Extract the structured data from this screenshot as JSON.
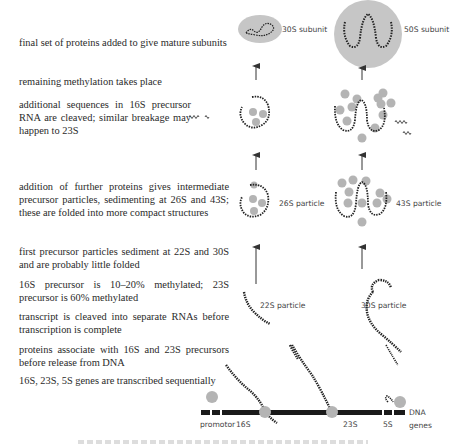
{
  "steps": [
    {
      "id": "final",
      "text": "final set of proteins added to give mature subunits"
    },
    {
      "id": "methylation",
      "text": "remaining methylation takes place"
    },
    {
      "id": "cleaved",
      "text": "additional sequences in 16S precursor RNA are cleaved; similar breakage may happen to 23S"
    },
    {
      "id": "intermediate",
      "text": "addition of further proteins gives intermediate precursor particles, sedimenting at 26S and 43S; these are folded into more compact structures"
    },
    {
      "id": "first",
      "text": "first precursor particles sediment at 22S and 30S and are probably little folded"
    },
    {
      "id": "methylated",
      "text": "16S precursor is 10–20% methylated; 23S precursor is 60% methylated"
    },
    {
      "id": "transcript",
      "text": "transcript is cleaved into separate RNAs before transcription is complete"
    },
    {
      "id": "associate",
      "text": "proteins associate with 16S and 23S precursors before release from DNA"
    },
    {
      "id": "transcribed",
      "text": "16S, 23S, 5S genes are transcribed sequentially"
    }
  ],
  "labels": {
    "subunit_30s": "30S subunit",
    "subunit_50s": "50S subunit",
    "particle_26s": "26S particle",
    "particle_43s": "43S particle",
    "particle_22s": "22S particle",
    "particle_30s": "30S particle",
    "dna_line1": "DNA",
    "dna_line2": "genes",
    "promotor": "promotor",
    "gene_16s": "16S",
    "gene_23s": "23S",
    "gene_5s": "5S"
  },
  "colors": {
    "protein": "#b4b4b4",
    "subunit_fill": "#c6c6c6",
    "dna": "#1a1a1a",
    "arrow": "#333333"
  }
}
